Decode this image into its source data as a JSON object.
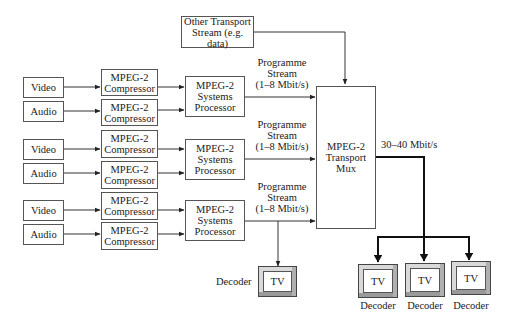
{
  "diagram": {
    "other_stream": {
      "line1": "Other Transport",
      "line2": "Stream (e.g. data)"
    },
    "channels": [
      {
        "video": "Video",
        "audio": "Audio",
        "video_compressor": {
          "line1": "MPEG-2",
          "line2": "Compressor"
        },
        "audio_compressor": {
          "line1": "MPEG-2",
          "line2": "Compressor"
        },
        "systems_processor": {
          "line1": "MPEG-2",
          "line2": "Systems",
          "line3": "Processor"
        },
        "stream_label": {
          "line1": "Programme",
          "line2": "Stream",
          "line3": "(1–8 Mbit/s)"
        }
      },
      {
        "video": "Video",
        "audio": "Audio",
        "video_compressor": {
          "line1": "MPEG-2",
          "line2": "Compressor"
        },
        "audio_compressor": {
          "line1": "MPEG-2",
          "line2": "Compressor"
        },
        "systems_processor": {
          "line1": "MPEG-2",
          "line2": "Systems",
          "line3": "Processor"
        },
        "stream_label": {
          "line1": "Programme",
          "line2": "Stream",
          "line3": "(1–8 Mbit/s)"
        }
      },
      {
        "video": "Video",
        "audio": "Audio",
        "video_compressor": {
          "line1": "MPEG-2",
          "line2": "Compressor"
        },
        "audio_compressor": {
          "line1": "MPEG-2",
          "line2": "Compressor"
        },
        "systems_processor": {
          "line1": "MPEG-2",
          "line2": "Systems",
          "line3": "Processor"
        },
        "stream_label": {
          "line1": "Programme",
          "line2": "Stream",
          "line3": "(1–8 Mbit/s)"
        }
      }
    ],
    "mux": {
      "line1": "MPEG-2",
      "line2": "Transport",
      "line3": "Mux"
    },
    "output_rate": "30–40 Mbit/s",
    "local_decoder": {
      "label": "Decoder",
      "tv": "TV"
    },
    "receivers": [
      {
        "tv": "TV",
        "label": "Decoder"
      },
      {
        "tv": "TV",
        "label": "Decoder"
      },
      {
        "tv": "TV",
        "label": "Decoder"
      }
    ]
  }
}
